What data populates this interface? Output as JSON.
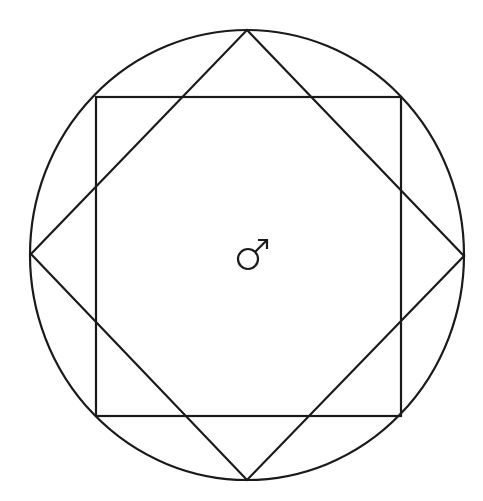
{
  "diagram": {
    "stroke_color": "#1a1a1a",
    "background_color": "#ffffff",
    "circle": {
      "cx": 247,
      "cy": 255,
      "rx": 217,
      "ry": 225
    },
    "square": {
      "x1": 96,
      "y1": 97,
      "x2": 401,
      "y2": 416
    },
    "diamond": {
      "top": [
        247,
        30
      ],
      "right": [
        464,
        256
      ],
      "bottom": [
        247,
        480
      ],
      "left": [
        31,
        254
      ]
    },
    "center_symbol": {
      "name": "mars-male-symbol",
      "glyph": "♂",
      "position": [
        252,
        255
      ]
    }
  }
}
